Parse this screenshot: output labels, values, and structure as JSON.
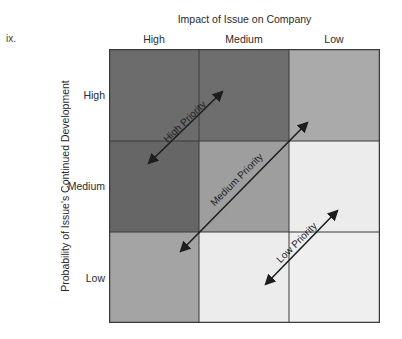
{
  "clip_text": "ix.",
  "matrix": {
    "x_axis_title": "Impact of Issue on Company",
    "y_axis_title": "Probability of  Issue's Continued Development",
    "columns": [
      "High",
      "Medium",
      "Low"
    ],
    "rows": [
      "High",
      "Medium",
      "Low"
    ],
    "cells": [
      [
        "#6c6c6c",
        "#6e6e6e",
        "#aaaaaa"
      ],
      [
        "#666666",
        "#9e9e9e",
        "#ececec"
      ],
      [
        "#a4a4a4",
        "#ececec",
        "#efefef"
      ]
    ],
    "priority_bands": [
      {
        "label": "High Priority",
        "from": [
          40,
          114
        ],
        "to": [
          113,
          43
        ]
      },
      {
        "label": "Medium Priority",
        "from": [
          72,
          202
        ],
        "to": [
          198,
          74
        ]
      },
      {
        "label": "Low Priority",
        "from": [
          157,
          235
        ],
        "to": [
          228,
          162
        ]
      }
    ]
  }
}
